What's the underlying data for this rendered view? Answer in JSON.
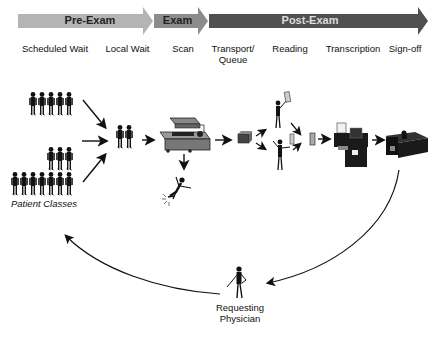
{
  "phases": [
    {
      "label": "Pre-Exam",
      "color": "#b0b0b0"
    },
    {
      "label": "Exam",
      "color": "#8a8a8a"
    },
    {
      "label": "Post-Exam",
      "color": "#555555"
    }
  ],
  "stages": [
    {
      "label": "Scheduled Wait"
    },
    {
      "label": "Local Wait"
    },
    {
      "label": "Scan"
    },
    {
      "label": "Transport/\nQueue",
      "line1": "Transport/",
      "line2": "Queue"
    },
    {
      "label": "Reading"
    },
    {
      "label": "Transcription"
    },
    {
      "label": "Sign-off"
    }
  ],
  "captions": {
    "patient_classes": "Patient Classes",
    "physician_line1": "Requesting",
    "physician_line2": "Physician"
  },
  "patient_groups": [
    {
      "count": 5
    },
    {
      "count": 3
    },
    {
      "count": 7
    }
  ],
  "local_wait_count": 2
}
